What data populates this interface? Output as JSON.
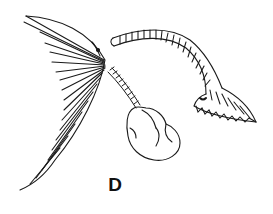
{
  "figure": {
    "panel_label": "D",
    "parts": [
      {
        "name": "feathery-fan",
        "description": "left fan-shaped structure with radiating filaments"
      },
      {
        "name": "ringed-stalk",
        "description": "segmented stalk connecting fan to bulb"
      },
      {
        "name": "bulb",
        "description": "lobed sac-like body"
      },
      {
        "name": "curved-tube",
        "description": "ringed arching tube ending in frilled funnel"
      }
    ],
    "colors": {
      "ink": "#1a1a1a",
      "background": "#ffffff"
    }
  }
}
